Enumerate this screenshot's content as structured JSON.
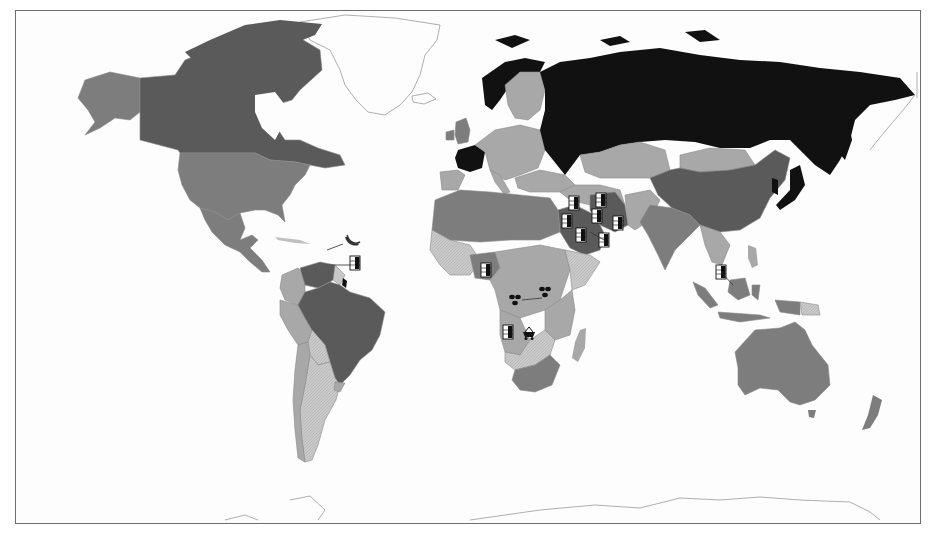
{
  "map": {
    "type": "choropleth-world-map",
    "style": "greyscale",
    "projection": "equirectangular-like",
    "shade_levels": {
      "darkest": "#111111",
      "dark": "#5a5a5a",
      "medium": "#7d7d7d",
      "light": "#a8a8a8",
      "lightest_hatched": "#c8c8c8",
      "no_data_outline": "#ffffff"
    },
    "regions": [
      {
        "name": "Russia",
        "shade": "darkest"
      },
      {
        "name": "France",
        "shade": "darkest"
      },
      {
        "name": "Japan",
        "shade": "darkest"
      },
      {
        "name": "Norway",
        "shade": "darkest"
      },
      {
        "name": "Canada",
        "shade": "dark"
      },
      {
        "name": "China",
        "shade": "dark"
      },
      {
        "name": "Brazil",
        "shade": "dark"
      },
      {
        "name": "Venezuela",
        "shade": "dark"
      },
      {
        "name": "Saudi Arabia",
        "shade": "dark"
      },
      {
        "name": "Iran",
        "shade": "dark"
      },
      {
        "name": "United States",
        "shade": "medium"
      },
      {
        "name": "Alaska",
        "shade": "medium"
      },
      {
        "name": "Mexico",
        "shade": "medium"
      },
      {
        "name": "Australia",
        "shade": "medium"
      },
      {
        "name": "India",
        "shade": "medium"
      },
      {
        "name": "Indonesia",
        "shade": "medium"
      },
      {
        "name": "South Africa",
        "shade": "medium"
      },
      {
        "name": "Kazakhstan",
        "shade": "light"
      },
      {
        "name": "Mongolia",
        "shade": "light"
      },
      {
        "name": "Argentina",
        "shade": "lightest_hatched"
      },
      {
        "name": "Peru",
        "shade": "light"
      },
      {
        "name": "Greenland",
        "shade": "no_data_outline"
      },
      {
        "name": "Antarctica",
        "shade": "no_data_outline"
      }
    ],
    "resource_icons": [
      {
        "icon": "oil-barrel-icon",
        "location": "Venezuela / Caribbean",
        "x": 355,
        "y": 263
      },
      {
        "icon": "banana-icon",
        "location": "Caribbean",
        "x": 348,
        "y": 243
      },
      {
        "icon": "oil-barrel-icon",
        "location": "Nigeria",
        "x": 486,
        "y": 270
      },
      {
        "icon": "diamond-icon",
        "location": "Central African Republic",
        "x": 515,
        "y": 300
      },
      {
        "icon": "diamond-icon",
        "location": "Uganda / Rwanda",
        "x": 545,
        "y": 292
      },
      {
        "icon": "oil-barrel-icon",
        "location": "Angola",
        "x": 508,
        "y": 332
      },
      {
        "icon": "mine-cart-icon",
        "location": "Zambia / DR Congo",
        "x": 529,
        "y": 333
      },
      {
        "icon": "oil-barrel-icon",
        "location": "Iraq",
        "x": 574,
        "y": 203
      },
      {
        "icon": "oil-barrel-icon",
        "location": "Iran",
        "x": 601,
        "y": 200
      },
      {
        "icon": "oil-barrel-icon",
        "location": "Kuwait / Iran",
        "x": 597,
        "y": 216
      },
      {
        "icon": "oil-barrel-icon",
        "location": "Saudi Arabia",
        "x": 567,
        "y": 221
      },
      {
        "icon": "oil-barrel-icon",
        "location": "UAE",
        "x": 581,
        "y": 235
      },
      {
        "icon": "oil-barrel-icon",
        "location": "Oman",
        "x": 604,
        "y": 240
      },
      {
        "icon": "oil-barrel-icon",
        "location": "Pakistan",
        "x": 618,
        "y": 223
      },
      {
        "icon": "oil-barrel-icon",
        "location": "Brunei",
        "x": 721,
        "y": 272
      }
    ]
  }
}
